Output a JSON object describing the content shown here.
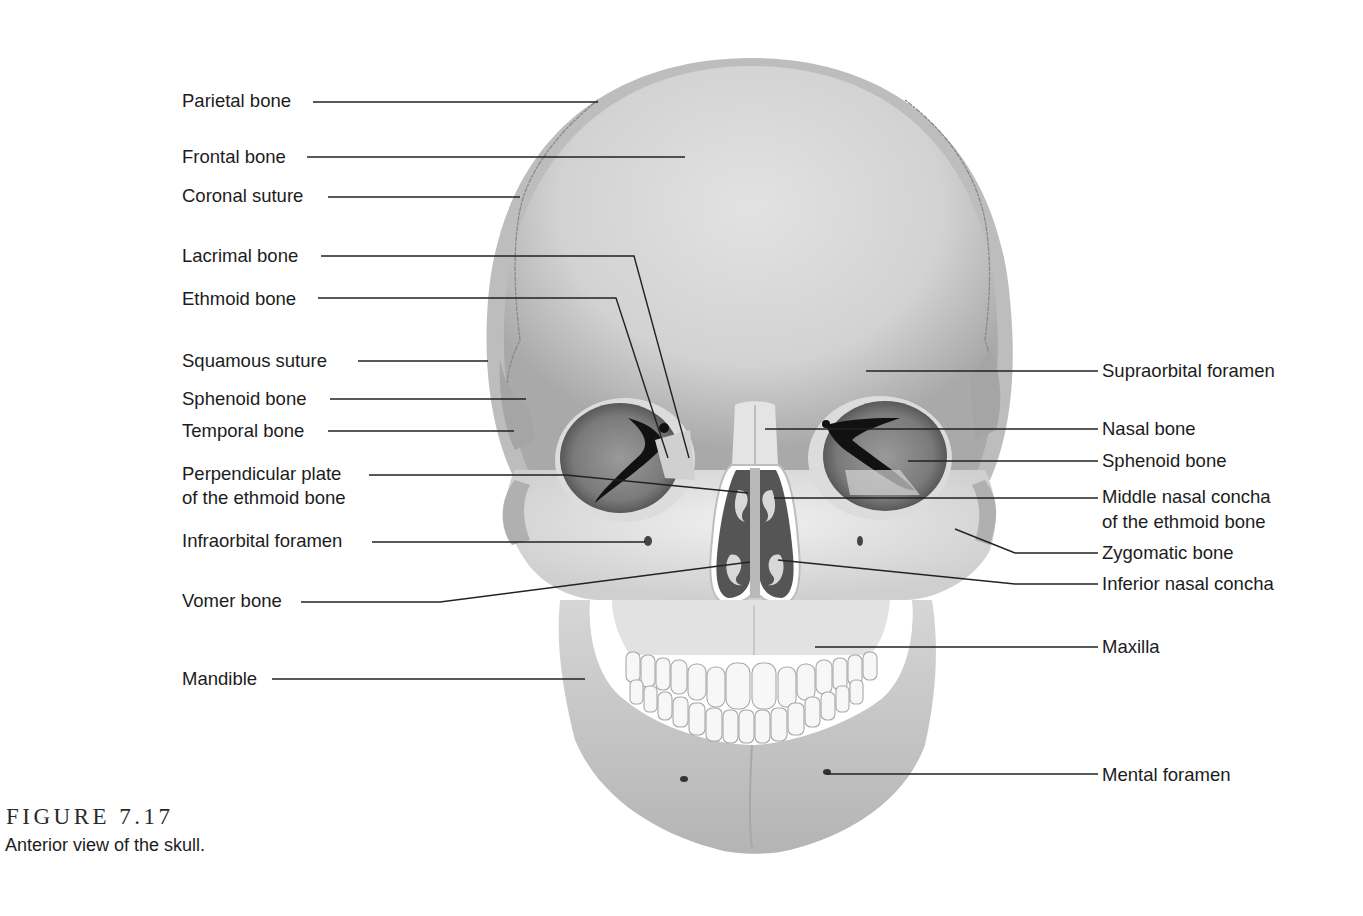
{
  "figure": {
    "number": "FIGURE 7.17",
    "caption": "Anterior view of the skull."
  },
  "labels_left": [
    {
      "id": "parietal-bone",
      "text": "Parietal bone",
      "x": 182,
      "y": 89
    },
    {
      "id": "frontal-bone",
      "text": "Frontal bone",
      "x": 182,
      "y": 145
    },
    {
      "id": "coronal-suture",
      "text": "Coronal suture",
      "x": 182,
      "y": 184
    },
    {
      "id": "lacrimal-bone",
      "text": "Lacrimal bone",
      "x": 182,
      "y": 244
    },
    {
      "id": "ethmoid-bone",
      "text": "Ethmoid bone",
      "x": 182,
      "y": 287
    },
    {
      "id": "squamous-suture",
      "text": "Squamous suture",
      "x": 182,
      "y": 349
    },
    {
      "id": "sphenoid-bone-left",
      "text": "Sphenoid bone",
      "x": 182,
      "y": 387
    },
    {
      "id": "temporal-bone",
      "text": "Temporal bone",
      "x": 182,
      "y": 419
    },
    {
      "id": "perpendicular-plate",
      "text": "Perpendicular plate",
      "x": 182,
      "y": 462
    },
    {
      "id": "perpendicular-plate-2",
      "text": "of the ethmoid bone",
      "x": 182,
      "y": 486
    },
    {
      "id": "infraorbital-foramen",
      "text": "Infraorbital foramen",
      "x": 182,
      "y": 529
    },
    {
      "id": "vomer-bone",
      "text": "Vomer bone",
      "x": 182,
      "y": 589
    },
    {
      "id": "mandible",
      "text": "Mandible",
      "x": 182,
      "y": 667
    }
  ],
  "labels_right": [
    {
      "id": "supraorbital-foramen",
      "text": "Supraorbital foramen",
      "x": 1102,
      "y": 359
    },
    {
      "id": "nasal-bone",
      "text": "Nasal bone",
      "x": 1102,
      "y": 417
    },
    {
      "id": "sphenoid-bone-right",
      "text": "Sphenoid bone",
      "x": 1102,
      "y": 449
    },
    {
      "id": "middle-nasal-concha",
      "text": "Middle nasal concha",
      "x": 1102,
      "y": 485
    },
    {
      "id": "middle-nasal-concha-2",
      "text": "of the ethmoid bone",
      "x": 1102,
      "y": 510
    },
    {
      "id": "zygomatic-bone",
      "text": "Zygomatic bone",
      "x": 1102,
      "y": 541
    },
    {
      "id": "inferior-nasal-concha",
      "text": "Inferior nasal concha",
      "x": 1102,
      "y": 572
    },
    {
      "id": "maxilla",
      "text": "Maxilla",
      "x": 1102,
      "y": 635
    },
    {
      "id": "mental-foramen",
      "text": "Mental foramen",
      "x": 1102,
      "y": 763
    }
  ],
  "leaders": [
    {
      "for": "parietal-bone",
      "points": "313,102 598,102"
    },
    {
      "for": "frontal-bone",
      "points": "307,157 685,157"
    },
    {
      "for": "coronal-suture",
      "points": "328,197 520,197"
    },
    {
      "for": "lacrimal-bone",
      "points": "321,256 634,256 689,458"
    },
    {
      "for": "ethmoid-bone",
      "points": "318,298 616,298 668,458"
    },
    {
      "for": "squamous-suture",
      "points": "358,361 488,361"
    },
    {
      "for": "sphenoid-bone-left",
      "points": "330,399 526,399"
    },
    {
      "for": "temporal-bone",
      "points": "328,431 514,431"
    },
    {
      "for": "perpendicular-plate",
      "points": "369,475 566,475 748,493"
    },
    {
      "for": "infraorbital-foramen",
      "points": "372,542 645,542"
    },
    {
      "for": "vomer-bone",
      "points": "301,602 440,602 750,562"
    },
    {
      "for": "mandible",
      "points": "272,679 585,679"
    },
    {
      "for": "supraorbital-foramen",
      "points": "866,371 1098,371"
    },
    {
      "for": "nasal-bone",
      "points": "765,429 1098,429"
    },
    {
      "for": "sphenoid-bone-right",
      "points": "908,461 1098,461"
    },
    {
      "for": "middle-nasal-concha",
      "points": "774,498 1098,498"
    },
    {
      "for": "zygomatic-bone",
      "points": "955,529 1015,553 1098,553"
    },
    {
      "for": "inferior-nasal-concha",
      "points": "778,560 1015,584 1098,584"
    },
    {
      "for": "maxilla",
      "points": "815,647 1098,647"
    },
    {
      "for": "mental-foramen",
      "points": "827,774 1098,774"
    }
  ],
  "colors": {
    "bone_light": "#e6e6e6",
    "bone_mid": "#c8c8c8",
    "bone_dark": "#9a9a9a",
    "cavity": "#555555",
    "fissure": "#111111",
    "text": "#1c1c1c"
  }
}
